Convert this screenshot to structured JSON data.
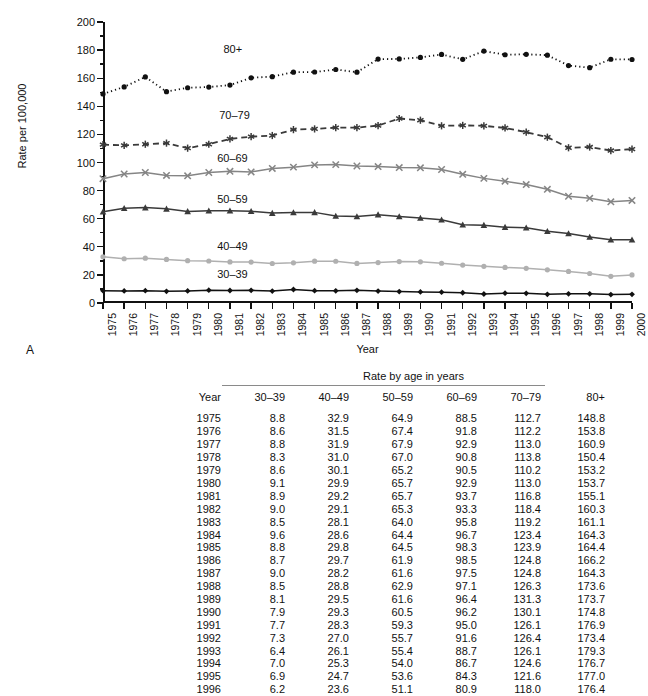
{
  "figure": {
    "panel_letter": "A",
    "ylabel": "Rate per 100,000",
    "xlabel": "Year",
    "series_labels": {
      "s80": "80+",
      "s70": "70–79",
      "s60": "60–69",
      "s50": "50–59",
      "s40": "40–49",
      "s30": "30–39"
    }
  },
  "table": {
    "supertitle": "Rate by age in years",
    "headers": [
      "Year",
      "30–39",
      "40–49",
      "50–59",
      "60–69",
      "70–79",
      "80+"
    ],
    "rows": [
      [
        "1975",
        "8.8",
        "32.9",
        "64.9",
        "88.5",
        "112.7",
        "148.8"
      ],
      [
        "1976",
        "8.6",
        "31.5",
        "67.4",
        "91.8",
        "112.2",
        "153.8"
      ],
      [
        "1977",
        "8.8",
        "31.9",
        "67.9",
        "92.9",
        "113.0",
        "160.9"
      ],
      [
        "1978",
        "8.3",
        "31.0",
        "67.0",
        "90.8",
        "113.8",
        "150.4"
      ],
      [
        "1979",
        "8.6",
        "30.1",
        "65.2",
        "90.5",
        "110.2",
        "153.2"
      ],
      [
        "1980",
        "9.1",
        "29.9",
        "65.7",
        "92.9",
        "113.0",
        "153.7"
      ],
      [
        "1981",
        "8.9",
        "29.2",
        "65.7",
        "93.7",
        "116.8",
        "155.1"
      ],
      [
        "1982",
        "9.0",
        "29.1",
        "65.3",
        "93.3",
        "118.4",
        "160.3"
      ],
      [
        "1983",
        "8.5",
        "28.1",
        "64.0",
        "95.8",
        "119.2",
        "161.1"
      ],
      [
        "1984",
        "9.6",
        "28.6",
        "64.4",
        "96.7",
        "123.4",
        "164.3"
      ],
      [
        "1985",
        "8.8",
        "29.8",
        "64.5",
        "98.3",
        "123.9",
        "164.4"
      ],
      [
        "1986",
        "8.7",
        "29.7",
        "61.9",
        "98.5",
        "124.8",
        "166.2"
      ],
      [
        "1987",
        "9.0",
        "28.2",
        "61.6",
        "97.5",
        "124.8",
        "164.3"
      ],
      [
        "1988",
        "8.5",
        "28.8",
        "62.9",
        "97.1",
        "126.3",
        "173.6"
      ],
      [
        "1989",
        "8.1",
        "29.5",
        "61.6",
        "96.4",
        "131.3",
        "173.7"
      ],
      [
        "1990",
        "7.9",
        "29.3",
        "60.5",
        "96.2",
        "130.1",
        "174.8"
      ],
      [
        "1991",
        "7.7",
        "28.3",
        "59.3",
        "95.0",
        "126.1",
        "176.9"
      ],
      [
        "1992",
        "7.3",
        "27.0",
        "55.7",
        "91.6",
        "126.4",
        "173.4"
      ],
      [
        "1993",
        "6.4",
        "26.1",
        "55.4",
        "88.7",
        "126.1",
        "179.3"
      ],
      [
        "1994",
        "7.0",
        "25.3",
        "54.0",
        "86.7",
        "124.6",
        "176.7"
      ],
      [
        "1995",
        "6.9",
        "24.7",
        "53.6",
        "84.3",
        "121.6",
        "177.0"
      ],
      [
        "1996",
        "6.2",
        "23.6",
        "51.1",
        "80.9",
        "118.0",
        "176.4"
      ]
    ]
  },
  "chart_data": {
    "type": "line",
    "title": "",
    "xlabel": "Year",
    "ylabel": "Rate per 100,000",
    "xlim": [
      1975,
      2000
    ],
    "ylim": [
      0,
      200
    ],
    "y_major_ticks": [
      0,
      20,
      40,
      60,
      80,
      100,
      120,
      140,
      160,
      180,
      200
    ],
    "y_minor_step": 10,
    "grid": false,
    "legend": "inline-labels",
    "x": [
      1975,
      1976,
      1977,
      1978,
      1979,
      1980,
      1981,
      1982,
      1983,
      1984,
      1985,
      1986,
      1987,
      1988,
      1989,
      1990,
      1991,
      1992,
      1993,
      1994,
      1995,
      1996,
      1997,
      1998,
      1999,
      2000
    ],
    "series": [
      {
        "name": "80+",
        "color": "#111111",
        "marker": "circle",
        "linestyle": "dotted",
        "label_x": 1980.6,
        "label_y": 180.0,
        "values": [
          148.8,
          153.8,
          160.9,
          150.4,
          153.2,
          153.7,
          155.1,
          160.3,
          161.1,
          164.3,
          164.4,
          166.2,
          164.3,
          173.6,
          173.7,
          174.8,
          176.9,
          173.4,
          179.3,
          176.7,
          177.0,
          176.4,
          169.0,
          167.5,
          173.5,
          173.3
        ]
      },
      {
        "name": "70–79",
        "color": "#3a3a3a",
        "marker": "asterisk",
        "linestyle": "dashed",
        "label_x": 1980.4,
        "label_y": 133.0,
        "values": [
          112.7,
          112.2,
          113.0,
          113.8,
          110.2,
          113.0,
          116.8,
          118.4,
          119.2,
          123.4,
          123.9,
          124.8,
          124.8,
          126.3,
          131.3,
          130.1,
          126.1,
          126.4,
          126.1,
          124.6,
          121.6,
          118.0,
          110.5,
          111.0,
          108.5,
          109.5
        ]
      },
      {
        "name": "60–69",
        "color": "#858585",
        "marker": "x",
        "linestyle": "solid",
        "label_x": 1980.3,
        "label_y": 102.5,
        "values": [
          88.5,
          91.8,
          92.9,
          90.8,
          90.5,
          92.9,
          93.7,
          93.3,
          95.8,
          96.7,
          98.3,
          98.5,
          97.5,
          97.1,
          96.4,
          96.2,
          95.0,
          91.6,
          88.7,
          86.7,
          84.3,
          80.9,
          76.0,
          74.5,
          72.0,
          73.0
        ]
      },
      {
        "name": "50–59",
        "color": "#3a3a3a",
        "marker": "triangle",
        "linestyle": "solid",
        "label_x": 1980.3,
        "label_y": 73.0,
        "values": [
          64.9,
          67.4,
          67.9,
          67.0,
          65.2,
          65.7,
          65.7,
          65.3,
          64.0,
          64.4,
          64.5,
          61.9,
          61.6,
          62.9,
          61.6,
          60.5,
          59.3,
          55.7,
          55.4,
          54.0,
          53.6,
          51.1,
          49.5,
          47.0,
          45.0,
          45.0
        ]
      },
      {
        "name": "40–49",
        "color": "#b0b0b0",
        "marker": "circle",
        "linestyle": "solid",
        "label_x": 1980.3,
        "label_y": 40.0,
        "values": [
          32.9,
          31.5,
          31.9,
          31.0,
          30.1,
          29.9,
          29.2,
          29.1,
          28.1,
          28.6,
          29.8,
          29.7,
          28.2,
          28.8,
          29.5,
          29.3,
          28.3,
          27.0,
          26.1,
          25.3,
          24.7,
          23.6,
          22.5,
          21.0,
          19.0,
          20.0
        ]
      },
      {
        "name": "30–39",
        "color": "#111111",
        "marker": "diamond",
        "linestyle": "solid",
        "label_x": 1980.3,
        "label_y": 20.0,
        "values": [
          8.8,
          8.6,
          8.8,
          8.3,
          8.6,
          9.1,
          8.9,
          9.0,
          8.5,
          9.6,
          8.8,
          8.7,
          9.0,
          8.5,
          8.1,
          7.9,
          7.7,
          7.3,
          6.4,
          7.0,
          6.9,
          6.2,
          6.5,
          6.5,
          6.0,
          6.2
        ]
      }
    ]
  }
}
